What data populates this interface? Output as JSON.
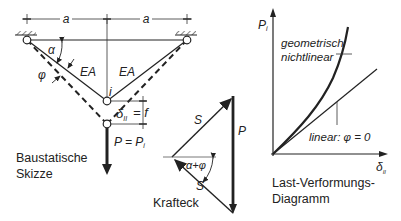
{
  "sketch": {
    "dim_label_left": "a",
    "dim_label_right": "a",
    "angle_alpha": "α",
    "angle_phi": "φ",
    "bar_left": "EA",
    "bar_right": "EA",
    "node_label": "i",
    "deflection": "δ",
    "deflection_sub": "II",
    "deflection_eq": "= f",
    "load": "P = P",
    "load_sub": "i",
    "caption_line1": "Baustatische",
    "caption_line2": "Skizze"
  },
  "force_polygon": {
    "force_top": "S",
    "force_bottom": "S",
    "force_vertical": "P",
    "angle": "α+φ",
    "caption": "Krafteck"
  },
  "diagram": {
    "y_axis": "P",
    "y_axis_sub": "i",
    "x_axis": "δ",
    "x_axis_sub": "II",
    "curve_nonlinear_line1": "geometrisch",
    "curve_nonlinear_line2": "nichtlinear",
    "curve_linear": "linear: φ = 0",
    "caption_line1": "Last-Verformungs-",
    "caption_line2": "Diagramm"
  }
}
